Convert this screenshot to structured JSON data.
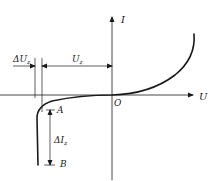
{
  "diagram": {
    "type": "zener-diode-IV-characteristic",
    "colors": {
      "stroke": "#1a1a1a",
      "background": "#ffffff"
    },
    "axes": {
      "y_label": "I",
      "x_label": "U",
      "origin_label": "O"
    },
    "points": {
      "A": "A",
      "B": "B"
    },
    "dimensions": {
      "delta_u": {
        "prefix": "ΔU",
        "sub": "z"
      },
      "u": {
        "prefix": "U",
        "sub": "z"
      },
      "delta_i": {
        "prefix": "ΔI",
        "sub": "z"
      }
    }
  }
}
